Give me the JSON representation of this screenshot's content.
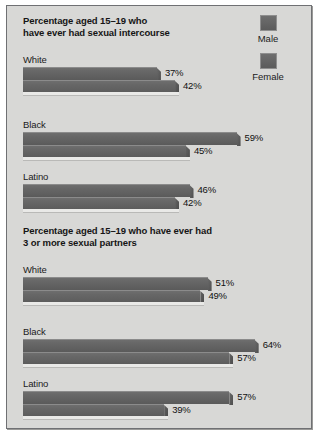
{
  "chart_data": {
    "type": "bar",
    "orientation": "horizontal",
    "xlabel": "",
    "ylabel": "",
    "xlim": [
      0,
      70
    ],
    "grid": false,
    "legend_position": "top-right",
    "legend": [
      "Male",
      "Female"
    ],
    "value_suffix": "%",
    "panels": [
      {
        "title": "Percentage aged 15–19 who\nhave ever had sexual intercourse",
        "categories": [
          "White",
          "Black",
          "Latino"
        ],
        "series": [
          {
            "name": "Male",
            "values": [
              37,
              59,
              46
            ]
          },
          {
            "name": "Female",
            "values": [
              42,
              45,
              42
            ]
          }
        ]
      },
      {
        "title": "Percentage aged 15–19 who have ever had\n3 or more sexual partners",
        "categories": [
          "White",
          "Black",
          "Latino"
        ],
        "series": [
          {
            "name": "Male",
            "values": [
              51,
              64,
              57
            ]
          },
          {
            "name": "Female",
            "values": [
              49,
              57,
              39
            ]
          }
        ]
      }
    ]
  },
  "legend": {
    "items": [
      {
        "label": "Male",
        "color": "#626262"
      },
      {
        "label": "Female",
        "color": "#626262"
      }
    ]
  },
  "panels": [
    {
      "title": "Percentage aged 15–19 who\nhave ever had sexual intercourse",
      "groups": [
        {
          "label": "White",
          "male": "37%",
          "female": "42%",
          "male_value": 37,
          "female_value": 42
        },
        {
          "label": "Black",
          "male": "59%",
          "female": "45%",
          "male_value": 59,
          "female_value": 45
        },
        {
          "label": "Latino",
          "male": "46%",
          "female": "42%",
          "male_value": 46,
          "female_value": 42
        }
      ]
    },
    {
      "title": "Percentage aged 15–19 who have ever had\n3 or more sexual partners",
      "groups": [
        {
          "label": "White",
          "male": "51%",
          "female": "49%",
          "male_value": 51,
          "female_value": 49
        },
        {
          "label": "Black",
          "male": "64%",
          "female": "57%",
          "male_value": 64,
          "female_value": 57
        },
        {
          "label": "Latino",
          "male": "57%",
          "female": "39%",
          "male_value": 57,
          "female_value": 39
        }
      ]
    }
  ],
  "style": {
    "bar_color": "#626262",
    "panel_background": "#d8d8d6",
    "border_color": "#6f7073",
    "text_color": "#151515",
    "px_per_percent": 3.62,
    "group_tops": [
      48,
      113,
      165
    ],
    "group_tops_panel2": [
      48,
      110,
      162
    ]
  }
}
